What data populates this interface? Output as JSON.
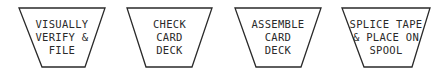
{
  "diagram": {
    "type": "flowchart-manual-operations",
    "shapes": [
      {
        "id": "s1",
        "shape": "trapezoid-manual-operation",
        "lines": [
          "VISUALLY",
          "VERIFY &",
          "FILE"
        ]
      },
      {
        "id": "s2",
        "shape": "trapezoid-manual-operation",
        "lines": [
          "CHECK",
          "CARD",
          "DECK"
        ]
      },
      {
        "id": "s3",
        "shape": "trapezoid-manual-operation",
        "lines": [
          "ASSEMBLE",
          "CARD",
          "DECK"
        ]
      },
      {
        "id": "s4",
        "shape": "trapezoid-manual-operation",
        "lines": [
          "SPLICE TAPE",
          "& PLACE ON",
          "SPOOL"
        ]
      }
    ],
    "colors": {
      "stroke": "#2a2a2a",
      "background": "#ffffff"
    }
  }
}
